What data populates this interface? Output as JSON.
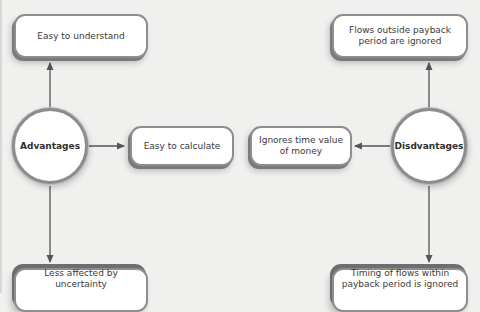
{
  "diagram": {
    "type": "mind-map",
    "colors": {
      "background": "#f0f0ee",
      "node_fill": "#ffffff",
      "node_border": "#8e8e8e",
      "connector": "#555555",
      "text": "#3a3a3a"
    },
    "hubs": {
      "advantages": {
        "label": "Advantages"
      },
      "disadvantages": {
        "label": "Disdvantages"
      }
    },
    "advantages": [
      {
        "label": "Easy to understand",
        "direction": "up"
      },
      {
        "label": "Easy to calculate",
        "direction": "right"
      },
      {
        "label": "Less affected by uncertainty",
        "direction": "down"
      }
    ],
    "disadvantages": [
      {
        "label": "Flows outside payback period are ignored",
        "direction": "up"
      },
      {
        "label": "Ignores time value of money",
        "direction": "left"
      },
      {
        "label": "Timing of flows within payback period is ignored",
        "direction": "down"
      }
    ],
    "edges": [
      {
        "from": "Advantages",
        "to": "Easy to understand"
      },
      {
        "from": "Advantages",
        "to": "Easy to calculate"
      },
      {
        "from": "Advantages",
        "to": "Less affected by uncertainty"
      },
      {
        "from": "Disdvantages",
        "to": "Flows outside payback period are ignored"
      },
      {
        "from": "Disdvantages",
        "to": "Ignores time value of money"
      },
      {
        "from": "Disdvantages",
        "to": "Timing of flows within payback period is ignored"
      }
    ]
  }
}
